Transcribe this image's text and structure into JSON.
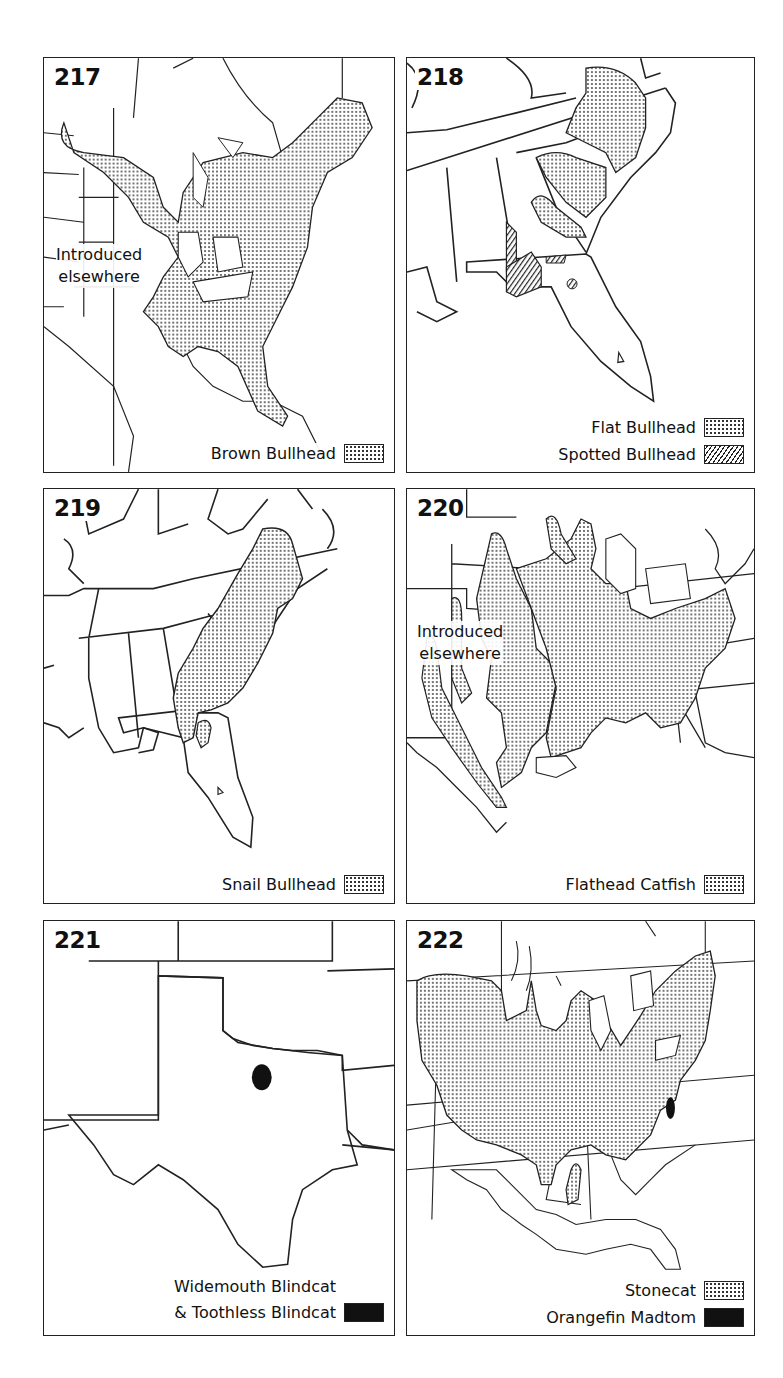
{
  "figures": [
    {
      "number": "217",
      "annotation": [
        "Introduced",
        "elsewhere"
      ],
      "legend": [
        {
          "label": "Brown Bullhead",
          "pattern": "stipple"
        }
      ]
    },
    {
      "number": "218",
      "legend": [
        {
          "label": "Flat Bullhead",
          "pattern": "stipple"
        },
        {
          "label": "Spotted Bullhead",
          "pattern": "hatch"
        }
      ]
    },
    {
      "number": "219",
      "legend": [
        {
          "label": "Snail Bullhead",
          "pattern": "stipple"
        }
      ]
    },
    {
      "number": "220",
      "annotation": [
        "Introduced",
        "elsewhere"
      ],
      "legend": [
        {
          "label": "Flathead Catfish",
          "pattern": "stipple"
        }
      ]
    },
    {
      "number": "221",
      "legend": [
        {
          "label": "Widemouth Blindcat\n& Toothless Blindcat",
          "line1": "Widemouth Blindcat",
          "line2": "& Toothless Blindcat",
          "pattern": "solid"
        }
      ]
    },
    {
      "number": "222",
      "legend": [
        {
          "label": "Stonecat",
          "pattern": "stipple"
        },
        {
          "label": "Orangefin Madtom",
          "pattern": "solid"
        }
      ]
    }
  ],
  "colors": {
    "ink": "#111111",
    "paper": "#ffffff"
  }
}
